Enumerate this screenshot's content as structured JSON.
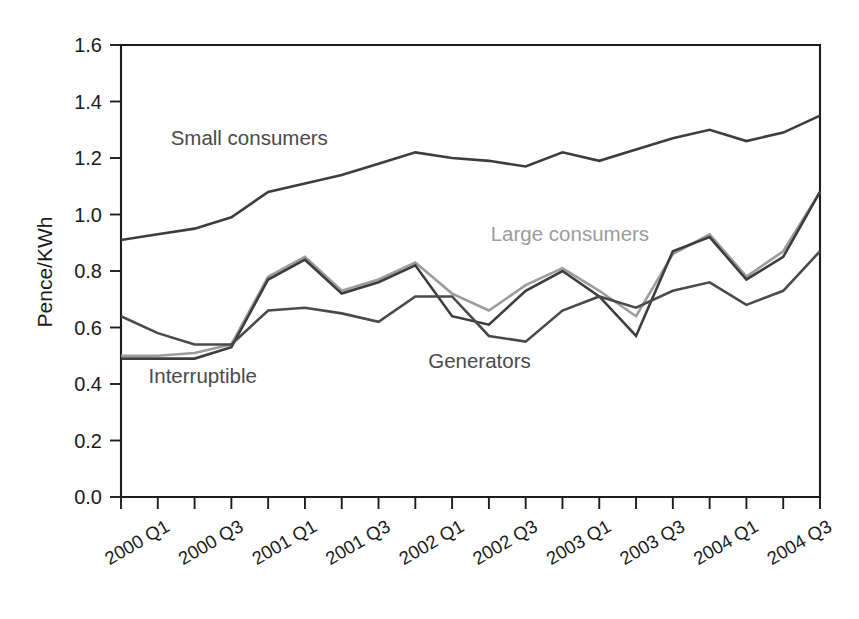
{
  "chart_data": {
    "type": "line",
    "title": "",
    "xlabel": "",
    "ylabel": "Pence/KWh",
    "ylim": [
      0.0,
      1.6
    ],
    "yticks": [
      0.0,
      0.2,
      0.4,
      0.6,
      0.8,
      1.0,
      1.2,
      1.4,
      1.6
    ],
    "ytick_labels": [
      "0.0",
      "0.2",
      "0.4",
      "0.6",
      "0.8",
      "1.0",
      "1.2",
      "1.4",
      "1.6"
    ],
    "grid": false,
    "legend_position": "inline-annotations",
    "categories": [
      "2000 Q1",
      "2000 Q2",
      "2000 Q3",
      "2000 Q4",
      "2001 Q1",
      "2001 Q2",
      "2001 Q3",
      "2001 Q4",
      "2002 Q1",
      "2002 Q2",
      "2002 Q3",
      "2002 Q4",
      "2003 Q1",
      "2003 Q2",
      "2003 Q3",
      "2003 Q4",
      "2004 Q1",
      "2004 Q2",
      "2004 Q3",
      "2004 Q4"
    ],
    "xtick_labels": [
      "2000 Q1",
      "",
      "2000 Q3",
      "",
      "2001 Q1",
      "",
      "2001 Q3",
      "",
      "2002 Q1",
      "",
      "2002 Q3",
      "",
      "2003 Q1",
      "",
      "2003 Q3",
      "",
      "2004 Q1",
      "",
      "2004 Q3",
      ""
    ],
    "series": [
      {
        "name": "Small consumers",
        "color": "#3d3d3d",
        "width": 2.6,
        "values": [
          0.91,
          0.93,
          0.95,
          0.99,
          1.08,
          1.11,
          1.14,
          1.18,
          1.22,
          1.2,
          1.19,
          1.17,
          1.22,
          1.19,
          1.23,
          1.27,
          1.3,
          1.26,
          1.29,
          1.35
        ]
      },
      {
        "name": "Large consumers",
        "color": "#9c9c9c",
        "width": 2.6,
        "values": [
          0.5,
          0.5,
          0.51,
          0.54,
          0.78,
          0.85,
          0.73,
          0.77,
          0.83,
          0.72,
          0.66,
          0.75,
          0.81,
          0.73,
          0.64,
          0.86,
          0.93,
          0.78,
          0.87,
          1.08
        ]
      },
      {
        "name": "Generators",
        "color": "#3d3d3d",
        "width": 2.6,
        "values": [
          0.49,
          0.49,
          0.49,
          0.53,
          0.77,
          0.84,
          0.72,
          0.76,
          0.82,
          0.64,
          0.61,
          0.73,
          0.8,
          0.71,
          0.57,
          0.87,
          0.92,
          0.77,
          0.85,
          1.08
        ]
      },
      {
        "name": "Interruptible",
        "color": "#4a4a4a",
        "width": 2.6,
        "values": [
          0.64,
          0.58,
          0.54,
          0.54,
          0.66,
          0.67,
          0.65,
          0.62,
          0.71,
          0.71,
          0.57,
          0.55,
          0.66,
          0.71,
          0.67,
          0.73,
          0.76,
          0.68,
          0.73,
          0.87
        ]
      }
    ],
    "annotations": [
      {
        "text": "Small consumers",
        "x": 1.35,
        "y": 1.245,
        "color": "#4a4a4a",
        "anchor": "start"
      },
      {
        "text": "Large consumers",
        "x": 10.05,
        "y": 0.905,
        "color": "#9c9c9c",
        "anchor": "start"
      },
      {
        "text": "Generators",
        "x": 8.35,
        "y": 0.455,
        "color": "#4a4a4a",
        "anchor": "start"
      },
      {
        "text": "Interruptible",
        "x": 0.75,
        "y": 0.405,
        "color": "#4a4a4a",
        "anchor": "start"
      }
    ]
  }
}
